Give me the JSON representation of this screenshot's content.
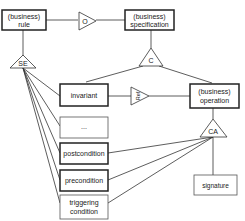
{
  "diagram": {
    "type": "conceptual-model",
    "colors": {
      "line": "#333333",
      "box_fill": "#ffffff",
      "text": "#222222"
    },
    "entities": {
      "rule": {
        "line1": "(business)",
        "line2": "rule",
        "style": "bold-border"
      },
      "specification": {
        "line1": "(business)",
        "line2": "specification",
        "style": "bold-border"
      },
      "invariant": {
        "label": "invariant",
        "style": "bold-border"
      },
      "operation": {
        "line1": "(business)",
        "line2": "operation",
        "style": "bold-border"
      },
      "ellipsis": {
        "label": "...",
        "style": "thin-border"
      },
      "postcondition": {
        "label": "postcondition",
        "style": "bold-border"
      },
      "precondition": {
        "label": "precondition",
        "style": "bold-border"
      },
      "triggering": {
        "line1": "triggering",
        "line2": "condition",
        "style": "thin-border"
      },
      "signature": {
        "label": "signature",
        "style": "thin-border"
      }
    },
    "relationships": {
      "O": {
        "label": "O",
        "direction": "right"
      },
      "C": {
        "label": "C",
        "direction": "up"
      },
      "SE": {
        "label": "SE",
        "direction": "up"
      },
      "Ref": {
        "label": "Ref",
        "direction": "right"
      },
      "CA": {
        "label": "CA",
        "direction": "up"
      }
    }
  }
}
